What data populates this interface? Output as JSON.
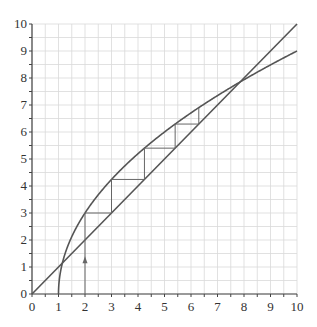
{
  "diagram": {
    "type": "cobweb",
    "axes": {
      "x_min": 0,
      "x_max": 10,
      "y_min": 0,
      "y_max": 10,
      "x_ticks": [
        "0",
        "1",
        "2",
        "3",
        "4",
        "5",
        "6",
        "7",
        "8",
        "9",
        "10"
      ],
      "y_ticks": [
        "0",
        "1",
        "2",
        "3",
        "4",
        "5",
        "6",
        "7",
        "8",
        "9",
        "10"
      ],
      "minor_step": 0.5
    },
    "curves": [
      {
        "name": "f(x) = 3*sqrt(x-1)",
        "color": "#555555"
      },
      {
        "name": "y = x",
        "color": "#555555"
      }
    ],
    "cobweb": {
      "start_x": 2,
      "arrow_at_y": 1.25,
      "points": [
        [
          2,
          0
        ],
        [
          2,
          3
        ],
        [
          3,
          3
        ],
        [
          3,
          4.243
        ],
        [
          4.243,
          4.243
        ],
        [
          4.243,
          5.402
        ],
        [
          5.402,
          5.402
        ],
        [
          5.402,
          6.294
        ],
        [
          6.294,
          6.294
        ],
        [
          6.294,
          6.902
        ]
      ],
      "color": "#666666"
    },
    "fixed_points": [
      [
        1.146,
        1.146
      ],
      [
        7.854,
        7.854
      ]
    ],
    "colors": {
      "grid": "#d9d9d9",
      "axis": "#444444",
      "curve": "#555555",
      "label": "#333333"
    }
  }
}
